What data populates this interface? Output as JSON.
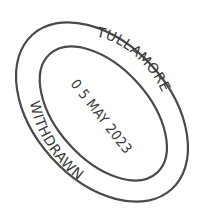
{
  "stamp": {
    "top_text": "TULLAMORE",
    "bottom_text": "WITHDRAWN",
    "date": "0 5 MAY 2023",
    "ink_color": "#3a3a3a",
    "ring_color": "#4a4a4a",
    "background": "#ffffff"
  }
}
